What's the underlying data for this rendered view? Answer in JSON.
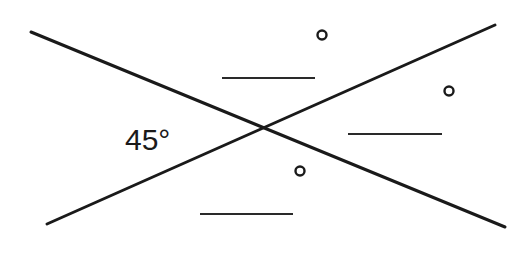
{
  "diagram": {
    "type": "intersecting-lines-vertical-angles",
    "intersection": {
      "x": 264,
      "y": 127
    },
    "lines": [
      {
        "name": "line-a",
        "x1": 31,
        "y1": 32,
        "x2": 505,
        "y2": 227
      },
      {
        "name": "line-b",
        "x1": 47,
        "y1": 224,
        "x2": 495,
        "y2": 25
      }
    ],
    "given_angle": {
      "label": "45°",
      "position": "left"
    },
    "unknown_angles": [
      {
        "position": "top",
        "blank": {
          "x1": 222,
          "x2": 315,
          "y": 78
        },
        "degree_symbol": {
          "cx": 322,
          "cy": 35
        }
      },
      {
        "position": "right",
        "blank": {
          "x1": 348,
          "x2": 442,
          "y": 134
        },
        "degree_symbol": {
          "cx": 449,
          "cy": 91
        }
      },
      {
        "position": "bottom",
        "blank": {
          "x1": 200,
          "x2": 293,
          "y": 214
        },
        "degree_symbol": {
          "cx": 300,
          "cy": 171
        }
      }
    ]
  }
}
